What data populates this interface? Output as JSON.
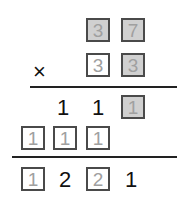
{
  "problem": {
    "operator": "×",
    "multiplicand": [
      {
        "value": "3",
        "boxed": true,
        "shaded": true
      },
      {
        "value": "7",
        "boxed": true,
        "shaded": true
      }
    ],
    "multiplier": [
      {
        "value": "3",
        "boxed": true,
        "shaded": false
      },
      {
        "value": "3",
        "boxed": true,
        "shaded": true
      }
    ],
    "partial_1": [
      {
        "value": "1",
        "boxed": false
      },
      {
        "value": "1",
        "boxed": false
      },
      {
        "value": "1",
        "boxed": true,
        "shaded": true
      }
    ],
    "partial_2": [
      {
        "value": "1",
        "boxed": true,
        "shaded": false
      },
      {
        "value": "1",
        "boxed": true,
        "shaded": false
      },
      {
        "value": "1",
        "boxed": true,
        "shaded": false
      }
    ],
    "result": [
      {
        "value": "1",
        "boxed": true,
        "shaded": false
      },
      {
        "value": "2",
        "boxed": false
      },
      {
        "value": "2",
        "boxed": true,
        "shaded": false
      },
      {
        "value": "1",
        "boxed": false
      }
    ]
  },
  "colors": {
    "box_fill_shaded": "#d0d0d0",
    "box_border": "#4a4a4a",
    "box_digit": "#a0a0a0",
    "plain_digit": "#111111"
  }
}
